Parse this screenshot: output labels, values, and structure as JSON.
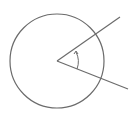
{
  "diagram": {
    "stroke_color": "#6b6b6b",
    "background": "#ffffff",
    "circle": {
      "cx": 57,
      "cy": 61,
      "r": 47
    },
    "vertex": {
      "x": 57,
      "y": 61
    },
    "rays": [
      {
        "name": "upper-ray",
        "x2": 120,
        "y2": 17
      },
      {
        "name": "lower-ray",
        "x2": 128,
        "y2": 89
      }
    ],
    "angle_arc": {
      "radius": 21,
      "arrow": "counterclockwise"
    }
  }
}
